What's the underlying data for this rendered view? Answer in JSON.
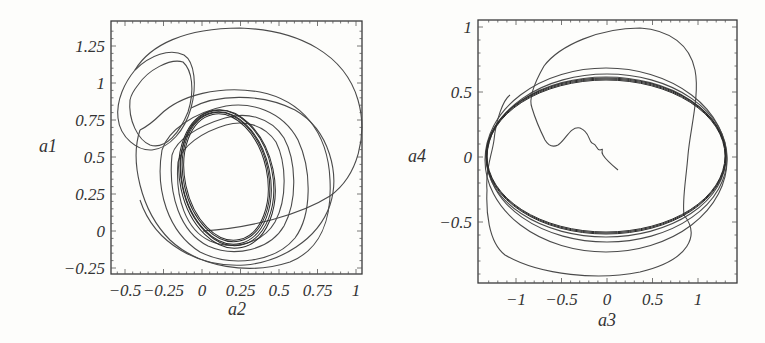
{
  "chart_data": [
    {
      "type": "line",
      "subtype": "phase_portrait",
      "title": "",
      "xlabel": "a2",
      "ylabel": "a1",
      "xlim": [
        -0.6,
        1.05
      ],
      "ylim": [
        -0.3,
        1.38
      ],
      "x_ticks": [
        "-0.5",
        "-0.25",
        "0",
        "0.25",
        "0.5",
        "0.75",
        "1"
      ],
      "x_tick_values": [
        -0.5,
        -0.25,
        0,
        0.25,
        0.5,
        0.75,
        1
      ],
      "y_ticks": [
        "1.25",
        "1",
        "0.75",
        "0.5",
        "0.25",
        "0",
        "-0.25"
      ],
      "y_tick_values": [
        1.25,
        1,
        0.75,
        0.5,
        0.25,
        0,
        -0.25
      ],
      "grid": false,
      "legend": null,
      "description": "Trajectory starting near (0,0) spiralling outward then converging to a limit cycle centred near (0.2, 0.3)",
      "features": {
        "limit_cycle": {
          "cx": 0.2,
          "cy": 0.3,
          "rx": 0.2,
          "ry": 0.4,
          "tilt_deg": -12
        },
        "large_loop": {
          "x_range": [
            -0.45,
            0.97
          ],
          "y_range": [
            -0.27,
            1.35
          ]
        },
        "small_upper_loop": {
          "x_range": [
            -0.58,
            -0.1
          ],
          "y_range": [
            0.55,
            1.15
          ]
        },
        "start_point": [
          0.0,
          0.0
        ]
      }
    },
    {
      "type": "line",
      "subtype": "phase_portrait",
      "title": "",
      "xlabel": "a3",
      "ylabel": "a4",
      "xlim": [
        -1.38,
        1.38
      ],
      "ylim": [
        -0.97,
        1.03
      ],
      "x_ticks": [
        "-1",
        "-0.5",
        "0",
        "0.5",
        "1"
      ],
      "x_tick_values": [
        -1,
        -0.5,
        0,
        0.5,
        1
      ],
      "y_ticks": [
        "1",
        "0.5",
        "0",
        "-0.5"
      ],
      "y_tick_values": [
        1,
        0.5,
        0,
        -0.5
      ],
      "grid": false,
      "legend": null,
      "description": "Trajectory starting near (0.1,-0.1) wandering up-left then converging onto an elliptical limit cycle",
      "features": {
        "limit_cycle": {
          "cx": 0.0,
          "cy": 0.0,
          "rx": 1.32,
          "ry": 0.72
        },
        "outer_excursion": {
          "x_range": [
            -1.35,
            1.3
          ],
          "y_range": [
            -0.88,
            0.95
          ]
        },
        "start_point": [
          0.1,
          -0.1
        ]
      }
    }
  ]
}
